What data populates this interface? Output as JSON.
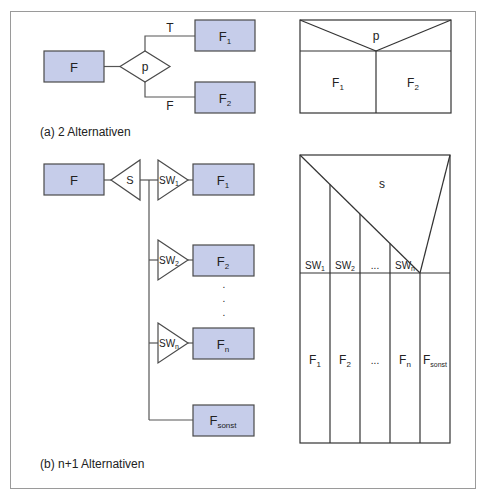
{
  "colors": {
    "box_fill": "#c6cdea",
    "box_stroke": "#4a4a4a",
    "line": "#555555",
    "frame": "#9a9a9a",
    "text": "#222222"
  },
  "part_a": {
    "caption": "(a) 2 Alternativen",
    "flowchart": {
      "start_box": "F",
      "decision": "p",
      "true_label": "T",
      "false_label": "F",
      "box_1": {
        "main": "F",
        "sub": "1"
      },
      "box_2": {
        "main": "F",
        "sub": "2"
      }
    },
    "nassi_shneiderman": {
      "condition": "p",
      "left": {
        "main": "F",
        "sub": "1"
      },
      "right": {
        "main": "F",
        "sub": "2"
      }
    }
  },
  "part_b": {
    "caption": "(b) n+1 Alternativen",
    "flowchart": {
      "start_box": "F",
      "selector": "S",
      "cases": [
        {
          "switch": {
            "main": "SW",
            "sub": "1"
          },
          "box": {
            "main": "F",
            "sub": "1"
          }
        },
        {
          "switch": {
            "main": "SW",
            "sub": "2"
          },
          "box": {
            "main": "F",
            "sub": "2"
          }
        },
        {
          "switch": {
            "main": "SW",
            "sub": "n"
          },
          "box": {
            "main": "F",
            "sub": "n"
          }
        }
      ],
      "ellipsis_dots": [
        ".",
        ".",
        "."
      ],
      "default_box": {
        "main": "F",
        "sub": "sonst"
      }
    },
    "nassi_shneiderman": {
      "selector": "s",
      "case_labels": [
        {
          "main": "SW",
          "sub": "1"
        },
        {
          "main": "SW",
          "sub": "2"
        },
        {
          "main": "...",
          "sub": ""
        },
        {
          "main": "SW",
          "sub": "n"
        }
      ],
      "columns": [
        {
          "main": "F",
          "sub": "1"
        },
        {
          "main": "F",
          "sub": "2"
        },
        {
          "main": "...",
          "sub": ""
        },
        {
          "main": "F",
          "sub": "n"
        },
        {
          "main": "F",
          "sub": "sonst"
        }
      ]
    }
  }
}
